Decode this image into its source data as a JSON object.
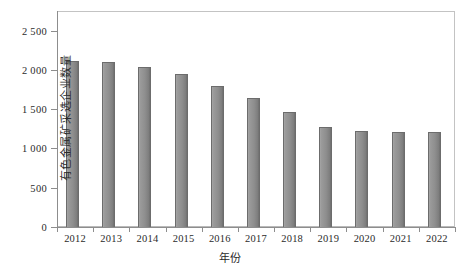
{
  "chart_data": {
    "type": "bar",
    "title": "",
    "xlabel": "年份",
    "ylabel": "有色金属矿采选企业数量",
    "categories": [
      "2012",
      "2013",
      "2014",
      "2015",
      "2016",
      "2017",
      "2018",
      "2019",
      "2020",
      "2021",
      "2022"
    ],
    "values": [
      2110,
      2095,
      2035,
      1950,
      1800,
      1640,
      1460,
      1275,
      1220,
      1215,
      1215
    ],
    "series": [
      {
        "name": "有色金属矿采选企业数量",
        "values": [
          2110,
          2095,
          2035,
          1950,
          1800,
          1640,
          1460,
          1275,
          1220,
          1215,
          1215
        ]
      }
    ],
    "ylim": [
      0,
      2750
    ],
    "y_ticks": [
      0,
      500,
      1000,
      1500,
      2000,
      2500
    ],
    "y_tick_labels": [
      "0",
      "500",
      "1 000",
      "1 500",
      "2 000",
      "2 500"
    ],
    "grid": false,
    "legend": "none",
    "bar_color": "#8e8e8e",
    "bar_edge_color": "#6c6c6c",
    "axis_color": "#8d8d8d",
    "frame_color": "#b9b9b9",
    "caption": ""
  }
}
